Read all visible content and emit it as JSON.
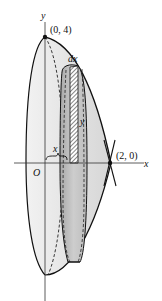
{
  "figure": {
    "curve": "y = 4 - x^2",
    "rotation_axis": "y",
    "labels": {
      "y_axis": "y",
      "x_axis": "x",
      "origin": "O",
      "top_point": "(0, 4)",
      "right_point": "(2, 0)",
      "shell_thickness": "dx",
      "shell_height": "y",
      "shell_radius": "x"
    },
    "points": [
      {
        "name": "top",
        "x": 0,
        "y": 4
      },
      {
        "name": "x-intercept",
        "x": 2,
        "y": 0
      }
    ],
    "colors": {
      "stroke": "#111111",
      "fill_light": "#e6e6e6",
      "fill_mid": "#cfcfcf",
      "fill_dark": "#b5b5b5"
    }
  }
}
